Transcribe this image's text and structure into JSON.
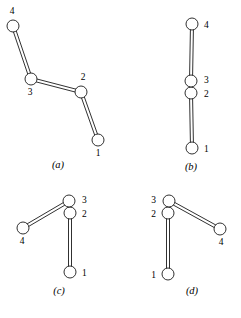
{
  "figure": {
    "type": "kinematic-linkage-configurations",
    "width": 241,
    "height": 318,
    "background_color": "#ffffff",
    "stroke_color": "#1a1a1a",
    "joint_fill_color": "#ffffff",
    "joint_radius": 6.0,
    "link_width": 3.0
  },
  "panels": [
    {
      "id": "a",
      "caption": "(a)",
      "caption_x": 58,
      "caption_y": 168,
      "joints": [
        {
          "id": "1",
          "label": "1",
          "x": 98,
          "y": 140,
          "label_x": 98,
          "label_y": 156,
          "label_anchor": "middle"
        },
        {
          "id": "2",
          "label": "2",
          "x": 81,
          "y": 92,
          "label_x": 83,
          "label_y": 80,
          "label_anchor": "middle"
        },
        {
          "id": "3",
          "label": "3",
          "x": 31,
          "y": 79,
          "label_x": 30,
          "label_y": 95,
          "label_anchor": "middle"
        },
        {
          "id": "4",
          "label": "4",
          "x": 13,
          "y": 26,
          "label_x": 12,
          "label_y": 14,
          "label_anchor": "middle"
        }
      ],
      "links": [
        {
          "from": "1",
          "to": "2"
        },
        {
          "from": "2",
          "to": "3"
        },
        {
          "from": "3",
          "to": "4"
        }
      ]
    },
    {
      "id": "b",
      "caption": "(b)",
      "caption_x": 191,
      "caption_y": 170,
      "joints": [
        {
          "id": "1",
          "label": "1",
          "x": 192,
          "y": 148,
          "label_x": 204,
          "label_y": 152,
          "label_anchor": "start"
        },
        {
          "id": "2",
          "label": "2",
          "x": 191,
          "y": 93,
          "label_x": 204,
          "label_y": 97,
          "label_anchor": "start"
        },
        {
          "id": "3",
          "label": "3",
          "x": 191,
          "y": 81,
          "label_x": 204,
          "label_y": 83,
          "label_anchor": "start"
        },
        {
          "id": "4",
          "label": "4",
          "x": 192,
          "y": 24,
          "label_x": 204,
          "label_y": 28,
          "label_anchor": "start"
        }
      ],
      "links": [
        {
          "from": "1",
          "to": "2"
        },
        {
          "from": "2",
          "to": "3"
        },
        {
          "from": "3",
          "to": "4"
        }
      ]
    },
    {
      "id": "c",
      "caption": "(c)",
      "caption_x": 59,
      "caption_y": 294,
      "joints": [
        {
          "id": "1",
          "label": "1",
          "x": 70,
          "y": 272,
          "label_x": 82,
          "label_y": 276,
          "label_anchor": "start"
        },
        {
          "id": "2",
          "label": "2",
          "x": 70,
          "y": 213,
          "label_x": 82,
          "label_y": 217,
          "label_anchor": "start"
        },
        {
          "id": "3",
          "label": "3",
          "x": 69,
          "y": 201,
          "label_x": 82,
          "label_y": 203,
          "label_anchor": "start"
        },
        {
          "id": "4",
          "label": "4",
          "x": 23,
          "y": 228,
          "label_x": 22,
          "label_y": 244,
          "label_anchor": "middle"
        }
      ],
      "links": [
        {
          "from": "1",
          "to": "2"
        },
        {
          "from": "2",
          "to": "3"
        },
        {
          "from": "3",
          "to": "4"
        }
      ]
    },
    {
      "id": "d",
      "caption": "(d)",
      "caption_x": 192,
      "caption_y": 294,
      "joints": [
        {
          "id": "1",
          "label": "1",
          "x": 168,
          "y": 274,
          "label_x": 156,
          "label_y": 278,
          "label_anchor": "end"
        },
        {
          "id": "2",
          "label": "2",
          "x": 168,
          "y": 213,
          "label_x": 156,
          "label_y": 217,
          "label_anchor": "end"
        },
        {
          "id": "3",
          "label": "3",
          "x": 169,
          "y": 201,
          "label_x": 156,
          "label_y": 203,
          "label_anchor": "end"
        },
        {
          "id": "4",
          "label": "4",
          "x": 220,
          "y": 229,
          "label_x": 221,
          "label_y": 245,
          "label_anchor": "middle"
        }
      ],
      "links": [
        {
          "from": "1",
          "to": "2"
        },
        {
          "from": "2",
          "to": "3"
        },
        {
          "from": "3",
          "to": "4"
        }
      ]
    }
  ]
}
